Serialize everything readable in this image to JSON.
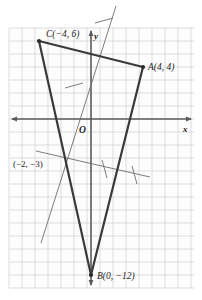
{
  "figure": {
    "background_color": "#ffffff",
    "grid": {
      "color": "#c9c9c9",
      "major_color": "#b0b0b0",
      "cell_px": 13,
      "left": 9,
      "top": 28,
      "right": 194,
      "bottom": 288,
      "visible": true
    },
    "axes": {
      "origin_label": "O",
      "x_label": "x",
      "y_label": "y",
      "color": "#555555",
      "origin_px": {
        "x": 91,
        "y": 119
      },
      "x_axis_y_px": 119,
      "y_axis_x_px": 91
    },
    "points": [
      {
        "name": "A",
        "label": "A(4, 4)",
        "coords": [
          4,
          4
        ],
        "px": [
          143,
          67
        ]
      },
      {
        "name": "C",
        "label": "C(−4, 6)",
        "coords": [
          -4,
          6
        ],
        "px": [
          39,
          41
        ]
      },
      {
        "name": "B",
        "label": "B(0, −12)",
        "coords": [
          0,
          -12
        ],
        "px": [
          91,
          275
        ]
      },
      {
        "name": "M",
        "label": "(−2, −3)",
        "coords": [
          -2,
          -3
        ],
        "px": [
          65,
          158
        ]
      }
    ],
    "triangle": {
      "vertices": [
        "C",
        "A",
        "B"
      ],
      "stroke_color": "#3a3a3a",
      "stroke_width": 2.2
    },
    "construction_lines": [
      {
        "name": "oblique-bisector",
        "from_px": [
          41,
          243
        ],
        "to_px": [
          116,
          6
        ],
        "stroke_color": "#6d6d6d",
        "stroke_width": 1,
        "tick_marks": 2
      },
      {
        "name": "shallow-bisector",
        "from_px": [
          36,
          151
        ],
        "to_px": [
          150,
          177
        ],
        "stroke_color": "#6d6d6d",
        "stroke_width": 1,
        "tick_marks": 2
      }
    ],
    "vertex_dot_color": "#2b2b2b"
  }
}
